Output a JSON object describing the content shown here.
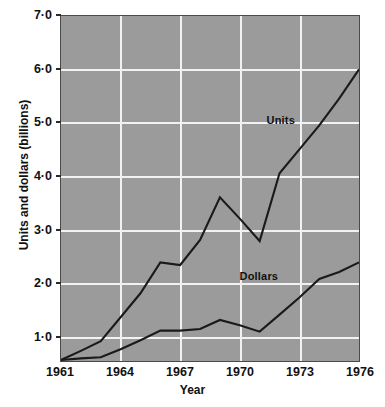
{
  "chart_data": {
    "type": "line",
    "title": "",
    "xlabel": "Year",
    "ylabel": "Units and dollars (billions)",
    "xlim": [
      1961,
      1976
    ],
    "ylim": [
      0.53,
      7.0
    ],
    "grid": true,
    "legend_position": "inline-annotation",
    "y_ticks": [
      "7·0",
      "6·0",
      "5·0",
      "4·0",
      "3·0",
      "2·0",
      "1·0"
    ],
    "y_tick_values": [
      7.0,
      6.0,
      5.0,
      4.0,
      3.0,
      2.0,
      1.0
    ],
    "x_ticks": [
      "1961",
      "1964",
      "1967",
      "1970",
      "1973",
      "1976"
    ],
    "x_tick_values": [
      1961,
      1964,
      1967,
      1970,
      1973,
      1976
    ],
    "x": [
      1961,
      1962,
      1963,
      1964,
      1965,
      1966,
      1967,
      1968,
      1969,
      1970,
      1971,
      1972,
      1973,
      1974,
      1975,
      1976
    ],
    "series": [
      {
        "name": "Units",
        "values": [
          0.55,
          0.72,
          0.9,
          1.35,
          1.8,
          2.38,
          2.33,
          2.8,
          3.6,
          3.2,
          2.78,
          4.05,
          4.5,
          4.95,
          5.45,
          6.0
        ]
      },
      {
        "name": "Dollars",
        "values": [
          0.55,
          0.58,
          0.6,
          0.75,
          0.92,
          1.1,
          1.1,
          1.13,
          1.3,
          1.2,
          1.08,
          1.4,
          1.72,
          2.07,
          2.2,
          2.38
        ]
      }
    ],
    "annotations": [
      {
        "text": "Units",
        "x": 1972.0,
        "y": 5.05
      },
      {
        "text": "Dollars",
        "x": 1970.9,
        "y": 2.13
      }
    ]
  }
}
